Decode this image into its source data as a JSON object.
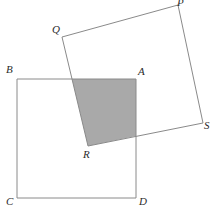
{
  "figure": {
    "canvas": {
      "width": 217,
      "height": 218
    },
    "colors": {
      "background": "#ffffff",
      "stroke": "#8a8a8a",
      "stroke_dark": "#6f6f6f",
      "shade_fill": "#a9a9a9",
      "label_color": "#2b2b2b"
    },
    "squares": [
      {
        "name": "square-abcd",
        "label": "ABCD",
        "vertices": [
          {
            "label": "B",
            "x": 17,
            "y": 79
          },
          {
            "label": "A",
            "x": 136,
            "y": 79
          },
          {
            "label": "D",
            "x": 136,
            "y": 198
          },
          {
            "label": "C",
            "x": 17,
            "y": 198
          }
        ]
      },
      {
        "name": "square-pqrs",
        "label": "PQRS",
        "vertices": [
          {
            "label": "Q",
            "x": 62,
            "y": 37
          },
          {
            "label": "P",
            "x": 178,
            "y": 5
          },
          {
            "label": "S",
            "x": 203,
            "y": 123
          },
          {
            "label": "R",
            "x": 88,
            "y": 146
          }
        ]
      }
    ],
    "shaded_region": {
      "name": "overlap-quadrilateral",
      "points": [
        {
          "x": 72,
          "y": 79
        },
        {
          "x": 136,
          "y": 79
        },
        {
          "x": 136,
          "y": 136
        },
        {
          "x": 88,
          "y": 146
        }
      ]
    },
    "labels": [
      {
        "text": "B",
        "x": 6,
        "y": 64,
        "name": "vertex-label-b"
      },
      {
        "text": "A",
        "x": 138,
        "y": 66,
        "name": "vertex-label-a"
      },
      {
        "text": "C",
        "x": 6,
        "y": 196,
        "name": "vertex-label-c"
      },
      {
        "text": "D",
        "x": 139,
        "y": 196,
        "name": "vertex-label-d"
      },
      {
        "text": "Q",
        "x": 52,
        "y": 24,
        "name": "vertex-label-q"
      },
      {
        "text": "P",
        "x": 177,
        "y": -3,
        "name": "vertex-label-p"
      },
      {
        "text": "S",
        "x": 204,
        "y": 120,
        "name": "vertex-label-s"
      },
      {
        "text": "R",
        "x": 83,
        "y": 149,
        "name": "vertex-label-r"
      }
    ]
  }
}
